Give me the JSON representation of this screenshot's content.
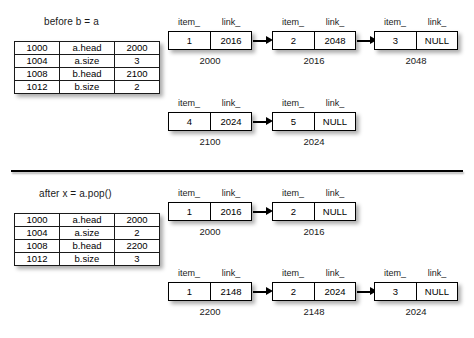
{
  "figure": {
    "divider_present": true,
    "colors": {
      "ink": "#000000",
      "background": "#ffffff",
      "shadow": "rgba(0,0,0,0.33)"
    }
  },
  "panels": [
    {
      "id": "before",
      "caption": "before b = a",
      "table": {
        "rows": [
          {
            "address": "1000",
            "name": "a.head",
            "value": "2000"
          },
          {
            "address": "1004",
            "name": "a.size",
            "value": "3"
          },
          {
            "address": "1008",
            "name": "b.head",
            "value": "2100"
          },
          {
            "address": "1012",
            "name": "b.size",
            "value": "2"
          }
        ]
      },
      "lists": [
        {
          "id": "list-a",
          "nodes": [
            {
              "item_label": "item_",
              "link_label": "link_",
              "item": "1",
              "link": "2016",
              "address": "2000"
            },
            {
              "item_label": "item_",
              "link_label": "link_",
              "item": "2",
              "link": "2048",
              "address": "2016"
            },
            {
              "item_label": "item_",
              "link_label": "link_",
              "item": "3",
              "link": "NULL",
              "address": "2048"
            }
          ]
        },
        {
          "id": "list-b",
          "nodes": [
            {
              "item_label": "item_",
              "link_label": "link_",
              "item": "4",
              "link": "2024",
              "address": "2100"
            },
            {
              "item_label": "item_",
              "link_label": "link_",
              "item": "5",
              "link": "NULL",
              "address": "2024"
            }
          ]
        }
      ]
    },
    {
      "id": "after",
      "caption": "after x = a.pop()",
      "table": {
        "rows": [
          {
            "address": "1000",
            "name": "a.head",
            "value": "2000"
          },
          {
            "address": "1004",
            "name": "a.size",
            "value": "2"
          },
          {
            "address": "1008",
            "name": "b.head",
            "value": "2200"
          },
          {
            "address": "1012",
            "name": "b.size",
            "value": "3"
          }
        ]
      },
      "lists": [
        {
          "id": "list-a",
          "nodes": [
            {
              "item_label": "item_",
              "link_label": "link_",
              "item": "1",
              "link": "2016",
              "address": "2000"
            },
            {
              "item_label": "item_",
              "link_label": "link_",
              "item": "2",
              "link": "NULL",
              "address": "2016"
            }
          ]
        },
        {
          "id": "list-b",
          "nodes": [
            {
              "item_label": "item_",
              "link_label": "link_",
              "item": "1",
              "link": "2148",
              "address": "2200"
            },
            {
              "item_label": "item_",
              "link_label": "link_",
              "item": "2",
              "link": "2024",
              "address": "2148"
            },
            {
              "item_label": "item_",
              "link_label": "link_",
              "item": "3",
              "link": "NULL",
              "address": "2024"
            }
          ]
        }
      ]
    }
  ]
}
